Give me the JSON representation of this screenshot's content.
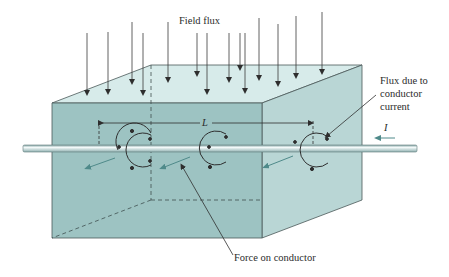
{
  "labels": {
    "field_flux": "Field flux",
    "flux_due_line1": "Flux due to",
    "flux_due_line2": "conductor",
    "flux_due_line3": "current",
    "current_symbol": "I",
    "length_symbol": "L",
    "force_on_conductor": "Force on conductor"
  },
  "colors": {
    "front_face": "#9fc4c4",
    "top_face": "#d9ecec",
    "side_face": "#bcd8d8",
    "edge": "#4a5a5a",
    "arrow": "#3a3a3a",
    "force_arrow": "#4f8a8a",
    "conductor": "#c8dcdc"
  },
  "field_flux_arrows": {
    "count": 14
  },
  "flux_circles": {
    "count": 3
  }
}
